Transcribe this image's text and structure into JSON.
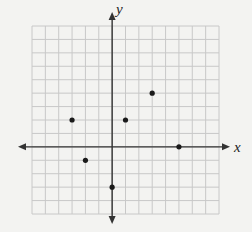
{
  "chart_data": {
    "type": "scatter",
    "title": "",
    "xlabel": "x",
    "ylabel": "y",
    "xlim": [
      -6,
      8
    ],
    "ylim": [
      -5,
      9
    ],
    "grid": true,
    "grid_step": 1,
    "tick_labels": false,
    "legend": null,
    "points": [
      {
        "x": -3,
        "y": 2
      },
      {
        "x": -2,
        "y": -1
      },
      {
        "x": 0,
        "y": -3
      },
      {
        "x": 1,
        "y": 2
      },
      {
        "x": 3,
        "y": 4
      },
      {
        "x": 5,
        "y": 0
      }
    ]
  },
  "colors": {
    "background": "#f3f3f1",
    "grid": "#c8c8c8",
    "axis": "#333333",
    "point": "#1a1a1a"
  }
}
